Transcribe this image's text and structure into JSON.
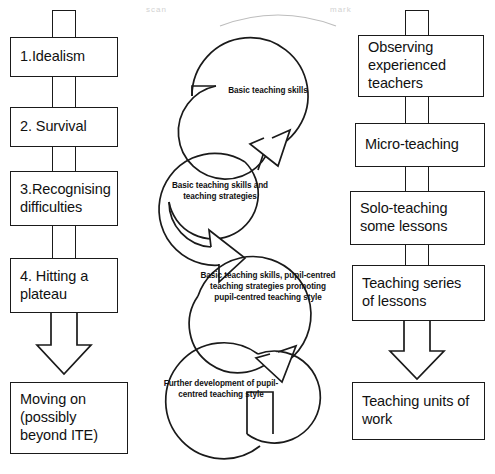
{
  "diagram": {
    "colors": {
      "stroke": "#1a1a1a",
      "background": "#ffffff",
      "text": "#111111"
    }
  },
  "left_column": {
    "name": "stages-of-development",
    "boxes": [
      {
        "id": "stage-1",
        "label": "1.Idealism"
      },
      {
        "id": "stage-2",
        "label": "2. Survival"
      },
      {
        "id": "stage-3",
        "label": "3.Recognising difficulties"
      },
      {
        "id": "stage-4",
        "label": "4. Hitting a plateau"
      },
      {
        "id": "stage-outcome",
        "label": "Moving on (possibly beyond ITE)"
      }
    ]
  },
  "right_column": {
    "name": "teaching-experience-progression",
    "boxes": [
      {
        "id": "experience-1",
        "label": "Observing experienced teachers"
      },
      {
        "id": "experience-2",
        "label": "Micro-teaching"
      },
      {
        "id": "experience-3",
        "label": "Solo-teaching some lessons"
      },
      {
        "id": "experience-4",
        "label": "Teaching series of lessons"
      },
      {
        "id": "experience-outcome",
        "label": "Teaching units of work"
      }
    ]
  },
  "centre_column": {
    "name": "skill-development-cycles",
    "cycles": [
      {
        "id": "cycle-1",
        "label": "Basic teaching skills"
      },
      {
        "id": "cycle-2",
        "label": "Basic teaching skills and teaching strategies"
      },
      {
        "id": "cycle-3",
        "label": "Basic teaching skills, pupil-centred teaching strategies promoting pupil-centred teaching style"
      },
      {
        "id": "cycle-4",
        "label": "Further development of pupil-centred teaching style"
      }
    ]
  },
  "artifacts": {
    "top_left": "scan",
    "top_right": "mark"
  }
}
